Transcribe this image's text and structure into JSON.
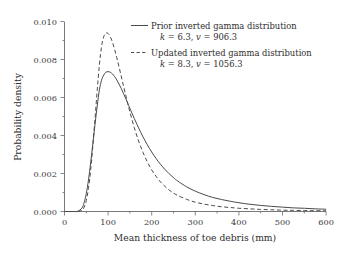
{
  "chart_data": {
    "type": "line",
    "title": "",
    "xlabel": "Mean thickness of toe debris (mm)",
    "ylabel": "Probability density",
    "xlim": [
      0,
      600
    ],
    "ylim": [
      0,
      0.01
    ],
    "xticks": [
      "0",
      "100",
      "200",
      "300",
      "400",
      "500",
      "600"
    ],
    "xtick_values": [
      0,
      100,
      200,
      300,
      400,
      500,
      600
    ],
    "yticks": [
      "0.000",
      "0.002",
      "0.004",
      "0.006",
      "0.008",
      "0.010"
    ],
    "ytick_values": [
      0.0,
      0.002,
      0.004,
      0.006,
      0.008,
      0.01
    ],
    "grid": false,
    "legend_position": "top-right",
    "series": [
      {
        "name": "Prior inverted gamma distribution",
        "style": "solid",
        "params": {
          "k": 6.3,
          "v": 906.3
        },
        "x": [
          0,
          20,
          30,
          40,
          45,
          50,
          55,
          60,
          65,
          70,
          75,
          80,
          85,
          90,
          95,
          100,
          105,
          110,
          115,
          120,
          125,
          130,
          135,
          140,
          145,
          150,
          160,
          170,
          180,
          190,
          200,
          210,
          220,
          230,
          240,
          250,
          260,
          280,
          300,
          320,
          340,
          360,
          380,
          400,
          425,
          450,
          475,
          500,
          525,
          550,
          575,
          600
        ],
        "values": [
          0.0,
          0.0,
          1e-05,
          0.00018,
          0.00046,
          0.00095,
          0.00166,
          0.00256,
          0.00357,
          0.00459,
          0.00555,
          0.0064,
          0.00691,
          0.00718,
          0.00733,
          0.00736,
          0.00733,
          0.00724,
          0.0071,
          0.00692,
          0.00671,
          0.00648,
          0.00623,
          0.00597,
          0.0057,
          0.00543,
          0.0049,
          0.0044,
          0.00393,
          0.00351,
          0.00313,
          0.00279,
          0.00249,
          0.00222,
          0.00199,
          0.00178,
          0.0016,
          0.0013,
          0.00107,
          0.00089,
          0.00074,
          0.00063,
          0.00054,
          0.00046,
          0.00038,
          0.00032,
          0.00027,
          0.00023,
          0.00019,
          0.00017,
          0.00014,
          0.00012
        ]
      },
      {
        "name": "Updated inverted gamma distribution",
        "style": "dashed",
        "params": {
          "k": 8.3,
          "v": 1056.3
        },
        "x": [
          0,
          20,
          30,
          40,
          45,
          50,
          55,
          60,
          65,
          70,
          75,
          80,
          85,
          90,
          95,
          100,
          105,
          110,
          115,
          120,
          125,
          130,
          135,
          140,
          145,
          150,
          160,
          170,
          180,
          190,
          200,
          210,
          220,
          230,
          240,
          250,
          260,
          280,
          300,
          320,
          340,
          360,
          380,
          400,
          425,
          450,
          475,
          500,
          525,
          550,
          575,
          600
        ],
        "values": [
          0.0,
          0.0,
          0.0,
          6e-05,
          0.00022,
          0.00058,
          0.00122,
          0.00218,
          0.00344,
          0.00489,
          0.00637,
          0.00772,
          0.00869,
          0.0092,
          0.00939,
          0.00937,
          0.0092,
          0.00891,
          0.00853,
          0.00809,
          0.00762,
          0.00713,
          0.00664,
          0.00616,
          0.00569,
          0.00524,
          0.00442,
          0.00371,
          0.00311,
          0.00261,
          0.00219,
          0.00185,
          0.00156,
          0.00133,
          0.00113,
          0.00097,
          0.00084,
          0.00064,
          0.00049,
          0.00039,
          0.00031,
          0.00025,
          0.00021,
          0.00017,
          0.00014,
          0.00011,
          9e-05,
          7e-05,
          6e-05,
          5e-05,
          4e-05,
          4e-05
        ]
      }
    ]
  },
  "legend": {
    "entries": [
      {
        "label": "Prior inverted gamma distribution",
        "param_k_symbol": "k",
        "param_k_value": " = 6.3, ",
        "param_v_symbol": "v",
        "param_v_value": " = 906.3",
        "sample": "solid-line"
      },
      {
        "label": "Updated inverted gamma distribution",
        "param_k_symbol": "k",
        "param_k_value": " = 8.3, ",
        "param_v_symbol": "v",
        "param_v_value": " = 1056.3",
        "sample": "dashed-line"
      }
    ]
  },
  "colors": {
    "curve": "#4a4a4a",
    "axis": "#6a6a6a",
    "text": "#2e2e2e",
    "background": "#ffffff"
  }
}
